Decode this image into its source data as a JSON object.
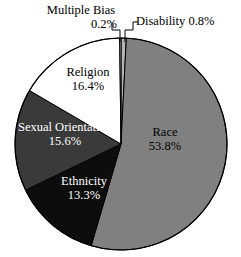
{
  "chart_data": {
    "type": "pie",
    "title": "",
    "subtitle": "",
    "xlabel": "",
    "ylabel": "",
    "legend_position": "none",
    "grid": false,
    "start_angle_deg": 0,
    "direction": "clockwise",
    "categories": [
      "Disability",
      "Race",
      "Ethnicity",
      "Sexual Orientation",
      "Religion",
      "Multiple Bias"
    ],
    "values": [
      0.8,
      53.8,
      13.3,
      15.6,
      16.4,
      0.2
    ],
    "units": "percent",
    "slices": [
      {
        "name": "Disability",
        "label": "Disability",
        "value": 0.8,
        "value_text": "0.8%",
        "label_text": "Disability 0.8%",
        "color": "#b4b4b4",
        "text_color": "#000000",
        "label_placement": "outside",
        "leader_line": true
      },
      {
        "name": "Race",
        "label": "Race",
        "value": 53.8,
        "value_text": "53.8%",
        "color": "#808080",
        "text_color": "#000000",
        "label_placement": "inside",
        "leader_line": false
      },
      {
        "name": "Ethnicity",
        "label": "Ethnicity",
        "value": 13.3,
        "value_text": "13.3%",
        "color": "#0d0d0d",
        "text_color": "#ffffff",
        "label_placement": "inside",
        "leader_line": false
      },
      {
        "name": "Sexual Orientation",
        "label": "Sexual Orientation",
        "value": 15.6,
        "value_text": "15.6%",
        "color": "#3a3a3a",
        "text_color": "#ffffff",
        "label_placement": "inside",
        "leader_line": false
      },
      {
        "name": "Religion",
        "label": "Religion",
        "value": 16.4,
        "value_text": "16.4%",
        "color": "#ffffff",
        "text_color": "#000000",
        "label_placement": "inside",
        "leader_line": false
      },
      {
        "name": "Multiple Bias",
        "label": "Multiple Bias",
        "value": 0.2,
        "value_text": "0.2%",
        "label_text": "Multiple Bias 0.2%",
        "color": "#e8e8e8",
        "text_color": "#000000",
        "label_placement": "outside",
        "leader_line": true
      }
    ]
  },
  "labels": {
    "multiple_bias": {
      "name": "Multiple Bias",
      "value": "0.2%"
    },
    "disability": {
      "text": "Disability 0.8%"
    },
    "race": {
      "name": "Race",
      "value": "53.8%"
    },
    "religion": {
      "name": "Religion",
      "value": "16.4%"
    },
    "sexual_orientation": {
      "name": "Sexual Orientation",
      "value": "15.6%"
    },
    "ethnicity": {
      "name": "Ethnicity",
      "value": "13.3%"
    }
  },
  "colors": {
    "race": "#808080",
    "ethnicity": "#0d0d0d",
    "sexual_orientation": "#3a3a3a",
    "religion": "#ffffff",
    "disability": "#b4b4b4",
    "multiple_bias": "#e8e8e8",
    "outline": "#000000",
    "background": "#ffffff"
  }
}
